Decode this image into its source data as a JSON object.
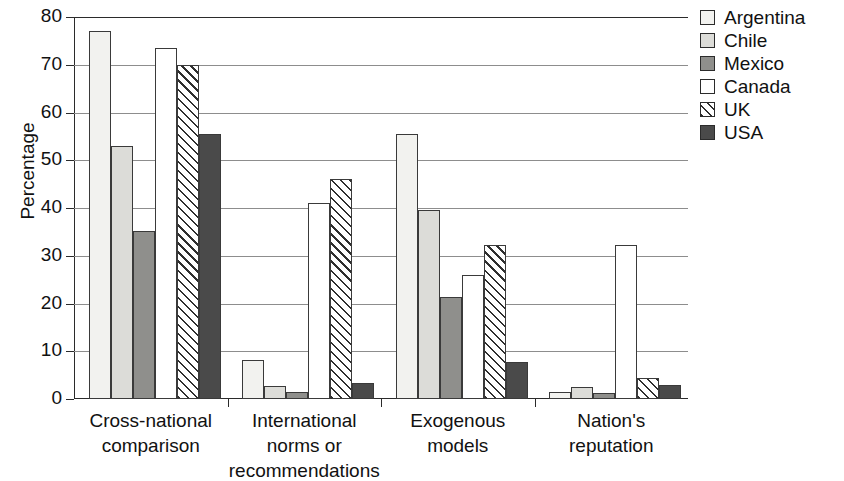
{
  "chart_data": {
    "type": "bar",
    "title": "",
    "xlabel": "",
    "ylabel": "Percentage",
    "ylim": [
      0,
      80
    ],
    "yticks": [
      0,
      10,
      20,
      30,
      40,
      50,
      60,
      70,
      80
    ],
    "grid": true,
    "legend_position": "right",
    "categories": [
      "Cross-national comparison",
      "International norms or recommendations",
      "Exogenous models",
      "Nation's reputation"
    ],
    "category_lines": [
      [
        "Cross-national",
        "comparison"
      ],
      [
        "International",
        "norms or",
        "recommendations"
      ],
      [
        "Exogenous",
        "models"
      ],
      [
        "Nation's",
        "reputation"
      ]
    ],
    "series": [
      {
        "name": "Argentina",
        "color": "#f2f2ef",
        "pattern": "solid",
        "values": [
          77.0,
          8.1,
          55.5,
          1.5
        ]
      },
      {
        "name": "Chile",
        "color": "#dcdcd8",
        "pattern": "solid",
        "values": [
          52.9,
          2.8,
          39.5,
          2.6
        ]
      },
      {
        "name": "Mexico",
        "color": "#8f8f8c",
        "pattern": "solid",
        "values": [
          35.1,
          1.5,
          21.4,
          1.3
        ]
      },
      {
        "name": "Canada",
        "color": "#ffffff",
        "pattern": "solid",
        "values": [
          73.6,
          41.0,
          26.0,
          32.3
        ]
      },
      {
        "name": "UK",
        "color": "#ffffff",
        "pattern": "diagonal-hatch",
        "values": [
          70.0,
          46.1,
          32.2,
          4.3
        ]
      },
      {
        "name": "USA",
        "color": "#4a4a4a",
        "pattern": "solid",
        "values": [
          55.4,
          3.4,
          7.8,
          2.9
        ]
      }
    ]
  },
  "legend": {
    "items": [
      {
        "label": "Argentina"
      },
      {
        "label": "Chile"
      },
      {
        "label": "Mexico"
      },
      {
        "label": "Canada"
      },
      {
        "label": "UK"
      },
      {
        "label": "USA"
      }
    ]
  },
  "axis": {
    "y_title": "Percentage",
    "tick_labels": [
      "80",
      "70",
      "60",
      "50",
      "40",
      "30",
      "20",
      "10",
      "0"
    ]
  }
}
